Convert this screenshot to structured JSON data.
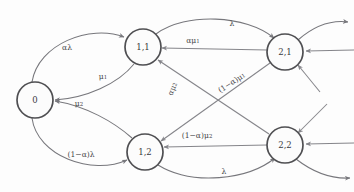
{
  "diagram": {
    "type": "markov-chain-state-transition-diagram",
    "background_color": "#fdfdfd",
    "node_stroke_color": "#4f4f52",
    "edge_color": "#77777c",
    "label_color": "#48484a",
    "nodes": [
      {
        "id": "0",
        "label": "0",
        "cx": 35,
        "cy": 100,
        "r": 18
      },
      {
        "id": "1,1",
        "label": "1,1",
        "cx": 143,
        "cy": 47,
        "r": 18
      },
      {
        "id": "1,2",
        "label": "1,2",
        "cx": 145,
        "cy": 152,
        "r": 18
      },
      {
        "id": "2,1",
        "label": "2,1",
        "cx": 285,
        "cy": 52,
        "r": 18
      },
      {
        "id": "2,2",
        "label": "2,2",
        "cx": 285,
        "cy": 145,
        "r": 18
      }
    ],
    "edges": [
      {
        "id": "e-0-to-11",
        "from": "0",
        "to": "1,1",
        "label": "αλ",
        "label_x": 67,
        "label_y": 48,
        "label_rotate": 0
      },
      {
        "id": "e-11-to-0",
        "from": "1,1",
        "to": "0",
        "label": "μ",
        "label_sub": "1",
        "label_x": 103,
        "label_y": 77,
        "label_rotate": 0
      },
      {
        "id": "e-0-to-12",
        "from": "0",
        "to": "1,2",
        "label": "(1−α)λ",
        "label_x": 81,
        "label_y": 155,
        "label_rotate": 0
      },
      {
        "id": "e-12-to-0",
        "from": "1,2",
        "to": "0",
        "label": "μ",
        "label_sub": "2",
        "label_x": 79,
        "label_y": 104,
        "label_rotate": 0
      },
      {
        "id": "e-11-to-21",
        "from": "1,1",
        "to": "2,1",
        "label": "λ",
        "label_x": 232,
        "label_y": 24,
        "label_rotate": 0
      },
      {
        "id": "e-21-to-11",
        "from": "2,1",
        "to": "1,1",
        "label": "αμ",
        "label_sub": "1",
        "label_x": 193,
        "label_y": 41,
        "label_rotate": 0
      },
      {
        "id": "e-12-to-22",
        "from": "1,2",
        "to": "2,2",
        "label": "λ",
        "label_x": 224,
        "label_y": 172,
        "label_rotate": 0
      },
      {
        "id": "e-22-to-12",
        "from": "2,2",
        "to": "1,2",
        "label": "(1−α)μ",
        "label_sub": "2",
        "label_x": 197,
        "label_y": 136,
        "label_rotate": 0
      },
      {
        "id": "e-22-to-11",
        "from": "2,2",
        "to": "1,1",
        "label": "αμ",
        "label_sub": "2",
        "label_x": 173,
        "label_y": 89,
        "label_rotate": -68
      },
      {
        "id": "e-21-to-12",
        "from": "2,1",
        "to": "1,2",
        "label": "(1−α)μ",
        "label_sub": "1",
        "label_x": 232,
        "label_y": 83,
        "label_rotate": -33
      }
    ],
    "boundary_edges": [
      {
        "id": "be-21-out-up",
        "node": "2,1",
        "direction": "outgoing",
        "side": "upper-right"
      },
      {
        "id": "be-21-in-right",
        "node": "2,1",
        "direction": "incoming",
        "side": "right"
      },
      {
        "id": "be-21-in-lower",
        "node": "2,1",
        "direction": "incoming",
        "side": "lower-right"
      },
      {
        "id": "be-22-in-upper",
        "node": "2,2",
        "direction": "incoming",
        "side": "upper-right"
      },
      {
        "id": "be-22-in-right",
        "node": "2,2",
        "direction": "incoming",
        "side": "right"
      },
      {
        "id": "be-22-out-lower",
        "node": "2,2",
        "direction": "outgoing",
        "side": "lower-right"
      }
    ]
  }
}
